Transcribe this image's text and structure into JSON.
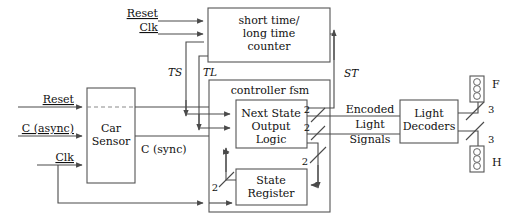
{
  "diagram": {
    "colors": {
      "wire": "#4a4a4a",
      "box_border": "#555555",
      "text": "#111111",
      "background": "#ffffff",
      "dashed_wire": "#8a8a8a"
    },
    "blocks": {
      "counter": {
        "line1": "short time/",
        "line2": "long time",
        "line3": "counter"
      },
      "car_sensor": {
        "line1": "Car",
        "line2": "Sensor"
      },
      "controller_fsm": {
        "label": "controller fsm"
      },
      "next_state_logic": {
        "line1": "Next State",
        "line2": "Output",
        "line3": "Logic"
      },
      "state_register": {
        "line1": "State",
        "line2": "Register"
      },
      "light_decoders": {
        "line1": "Light",
        "line2": "Decoders"
      }
    },
    "inputs": {
      "counter_reset": "Reset",
      "counter_clk": "Clk",
      "sensor_reset": "Reset",
      "sensor_c_async": "C (async)",
      "sensor_clk": "Clk"
    },
    "signals": {
      "c_sync": "C (sync)",
      "ts": "TS",
      "tl": "TL",
      "st": "ST",
      "encoded": "Encoded",
      "light": "Light",
      "signals": "Signals"
    },
    "bus_widths": {
      "enc_upper": "2",
      "enc_lower": "2",
      "next_state": "2",
      "state_feedback": "2",
      "light_f": "3",
      "light_h": "3"
    },
    "lights": {
      "farm": "F",
      "highway": "H"
    }
  }
}
